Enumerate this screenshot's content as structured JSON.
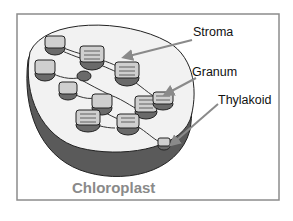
{
  "diagram": {
    "title": "Chloroplast",
    "labels": [
      {
        "id": "stroma",
        "text": "Stroma"
      },
      {
        "id": "granum",
        "text": "Granum"
      },
      {
        "id": "thylakoid",
        "text": "Thylakoid"
      }
    ],
    "colors": {
      "frame": "#8c8c8c",
      "outer_shell": "#5a5a5a",
      "inner_surface": "#f2f2f2",
      "granum_fill": "#cfcfcf",
      "granum_shadow": "#6a6a6a",
      "arrow": "#8a8a8a",
      "title": "#8a8a8a"
    }
  }
}
